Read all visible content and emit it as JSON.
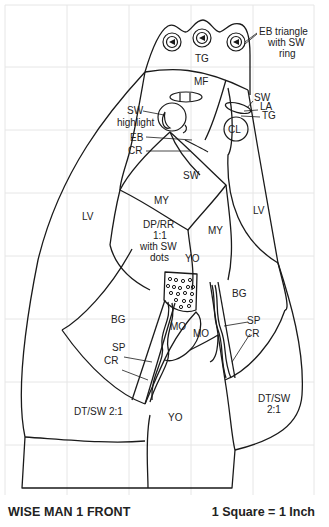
{
  "title": "WISE MAN 1 FRONT",
  "scale_note": "1 Square = 1 Inch",
  "colors": {
    "line": "#1a1a1a",
    "grid": "#e6e6e6",
    "text": "#222222",
    "background": "#ffffff"
  },
  "grid": {
    "cell_px": 62,
    "origin_x": 5,
    "origin_y": 5,
    "columns": 5,
    "rows": 8
  },
  "labels": {
    "eb_triangle_1": "EB triangle",
    "eb_triangle_2": "with SW",
    "eb_triangle_3": "ring",
    "tg_crown": "TG",
    "mf": "MF",
    "sw_right": "SW",
    "la": "LA",
    "tg_eye": "TG",
    "cl": "CL",
    "sw_highlight_1": "SW",
    "sw_highlight_2": "highlight",
    "eb": "EB",
    "cr_face": "CR",
    "sw_beard": "SW",
    "lv_left": "LV",
    "lv_right": "LV",
    "my_left": "MY",
    "my_right": "MY",
    "dp_1": "DP/RR",
    "dp_2": "1:1",
    "dp_3": "with SW",
    "dp_4": "dots",
    "yo_top": "YO",
    "bg_left": "BG",
    "bg_right": "BG",
    "mo_left": "MO",
    "mo_right": "MO",
    "sp_left": "SP",
    "cr_left": "CR",
    "sp_right": "SP",
    "cr_right": "CR",
    "dt_left": "DT/SW 2:1",
    "yo_bottom": "YO",
    "dt_right_1": "DT/SW",
    "dt_right_2": "2:1"
  }
}
